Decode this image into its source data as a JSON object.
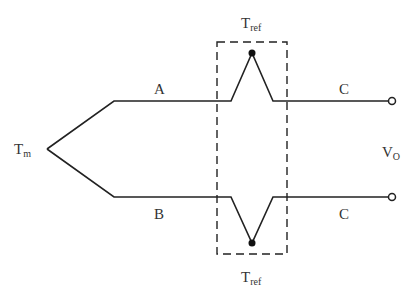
{
  "diagram": {
    "type": "thermocouple-circuit",
    "labels": {
      "measuring_junction": {
        "main": "T",
        "sub": "m"
      },
      "ref_junction_top": {
        "main": "T",
        "sub": "ref"
      },
      "ref_junction_bottom": {
        "main": "T",
        "sub": "ref"
      },
      "output_voltage": {
        "main": "V",
        "sub": "O"
      },
      "wire_top": "A",
      "wire_bottom": "B",
      "lead_top": "C",
      "lead_bottom": "C"
    },
    "colors": {
      "line": "#222222",
      "text": "#333333"
    }
  }
}
